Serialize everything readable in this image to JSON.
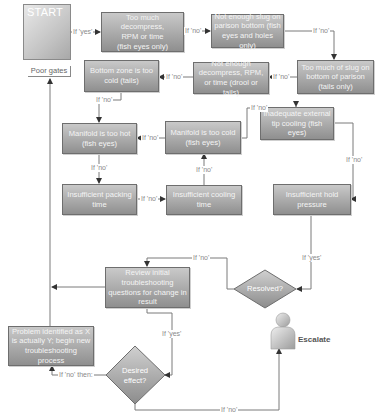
{
  "start": {
    "label": "START",
    "icon": "door-hanger-exclamation-icon",
    "sublabel": "Poor gates"
  },
  "nodes": [
    {
      "id": "too-much-decompress",
      "lines": [
        "Too much decompress,",
        "RPM or time",
        "(fish eyes only)"
      ]
    },
    {
      "id": "not-enough-slug",
      "lines": [
        "Not enough slug on",
        "parison bottom (fish",
        "eyes and holes only)"
      ]
    },
    {
      "id": "too-much-slug",
      "lines": [
        "Too much of slug on",
        "bottom of parison",
        "(tails only)"
      ]
    },
    {
      "id": "not-enough-decompress",
      "lines": [
        "Not enough",
        "decompress, RPM,",
        "or time (drool or tails)"
      ]
    },
    {
      "id": "bottom-zone-cold",
      "lines": [
        "Bottom zone is too",
        "cold (tails)"
      ]
    },
    {
      "id": "manifold-too-hot",
      "lines": [
        "Manifold is too hot",
        "(fish eyes)"
      ]
    },
    {
      "id": "manifold-too-cold",
      "lines": [
        "Manifold is too cold",
        "(fish eyes)"
      ]
    },
    {
      "id": "inadequate-tip-cooling",
      "lines": [
        "Inadequate external",
        "tip cooling (fish eyes)"
      ]
    },
    {
      "id": "insufficient-packing",
      "lines": [
        "Insufficient packing",
        "time"
      ]
    },
    {
      "id": "insufficient-cooling",
      "lines": [
        "Insufficient cooling",
        "time"
      ]
    },
    {
      "id": "insufficient-hold",
      "lines": [
        "Insufficient hold",
        "pressure"
      ]
    },
    {
      "id": "review-initial",
      "lines": [
        "Review initial",
        "troubleshooting",
        "questions for change in",
        "result"
      ]
    },
    {
      "id": "problem-identified",
      "lines": [
        "Problem identified as X",
        "is actually Y; begin new",
        "troubleshooting process"
      ]
    }
  ],
  "decisions": [
    {
      "id": "resolved",
      "lines": [
        "Resolved?"
      ]
    },
    {
      "id": "desired-effect",
      "lines": [
        "Desired",
        "effect?"
      ]
    }
  ],
  "escalate": {
    "label": "Escalate",
    "icon": "person-icon"
  },
  "edge_labels": {
    "start_yes": "If 'yes'",
    "n1_no": "If 'no'",
    "n2_no": "If 'no'",
    "n3_no": "If 'no'",
    "n4_no": "If 'no'",
    "n5_no": "If 'no'",
    "n7_no_top": "If 'no'",
    "n7_no_left": "If 'no'",
    "n6_no": "If 'no'",
    "n9_no": "If 'no'",
    "n10_no": "If 'no'",
    "n8_no": "If 'no'",
    "hold_yes": "If 'yes'",
    "resolved_no": "If 'no'",
    "review_yes": "If 'yes'",
    "desired_no_then": "If 'no' then:",
    "desired_no": "If 'no'"
  },
  "colors": {
    "box_top": "#c9c9c9",
    "box_bottom": "#8f8f8f",
    "box_border": "#6e6e6e",
    "line": "#7a7a7a",
    "label_text": "#8a8a8a"
  }
}
